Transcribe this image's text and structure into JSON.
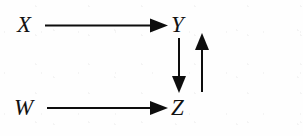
{
  "diagram": {
    "type": "directed-graph",
    "canvas": {
      "width": 303,
      "height": 136,
      "background": "#fefefe"
    },
    "ink_color": "#0d0d0d",
    "nodes": [
      {
        "id": "X",
        "label": "X",
        "x": 17,
        "y": 13
      },
      {
        "id": "Y",
        "label": "Y",
        "x": 171,
        "y": 13
      },
      {
        "id": "W",
        "label": "W",
        "x": 14,
        "y": 96
      },
      {
        "id": "Z",
        "label": "Z",
        "x": 171,
        "y": 96
      }
    ],
    "edges": [
      {
        "id": "x-to-y",
        "from": "X",
        "to": "Y",
        "direction": "right",
        "arrowhead": "filled-triangle"
      },
      {
        "id": "w-to-z",
        "from": "W",
        "to": "Z",
        "direction": "right",
        "arrowhead": "filled-triangle"
      },
      {
        "id": "y-to-z",
        "from": "Y",
        "to": "Z",
        "direction": "down",
        "arrowhead": "filled-triangle"
      },
      {
        "id": "z-to-y",
        "from": "Z",
        "to": "Y",
        "direction": "up",
        "arrowhead": "filled-triangle"
      }
    ]
  }
}
